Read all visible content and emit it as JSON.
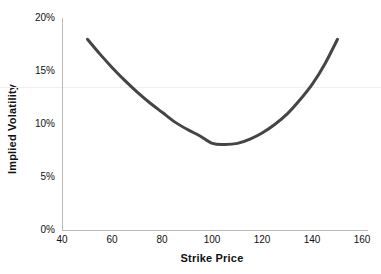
{
  "chart_data": {
    "type": "line",
    "title": "",
    "subtitle": "",
    "xlabel": "Strike Price",
    "ylabel": "Implied Volatility",
    "xlim": [
      40,
      160
    ],
    "ylim": [
      0,
      0.2
    ],
    "grid": false,
    "legend": null,
    "x_ticks": [
      "40",
      "60",
      "80",
      "100",
      "120",
      "140",
      "160"
    ],
    "x_tick_values": [
      40,
      60,
      80,
      100,
      120,
      140,
      160
    ],
    "y_ticks": [
      "0%",
      "5%",
      "10%",
      "15%",
      "20%"
    ],
    "y_tick_values": [
      0,
      0.05,
      0.1,
      0.15,
      0.2
    ],
    "series": [
      {
        "name": "Implied Volatility Smile",
        "color": "#454545",
        "line_width": 3,
        "x": [
          50,
          55,
          60,
          65,
          70,
          75,
          80,
          85,
          90,
          95,
          100,
          105,
          110,
          115,
          120,
          125,
          130,
          135,
          140,
          145,
          150
        ],
        "values": [
          0.18,
          0.166,
          0.153,
          0.141,
          0.13,
          0.12,
          0.111,
          0.102,
          0.095,
          0.089,
          0.082,
          0.081,
          0.082,
          0.086,
          0.092,
          0.1,
          0.11,
          0.123,
          0.138,
          0.157,
          0.18
        ]
      }
    ],
    "annotations": [
      {
        "name": "minimum-point",
        "x": 100,
        "y": 0.081,
        "note": "at-the-money minimum implied volatility"
      }
    ],
    "reference_line": {
      "name": "faint-horizontal-line",
      "y": 0.135,
      "color": "#f1eeee"
    }
  },
  "axis_colors": {
    "axis": "#b9b9b9",
    "text": "#111111",
    "curve": "#454545",
    "background": "#ffffff"
  }
}
